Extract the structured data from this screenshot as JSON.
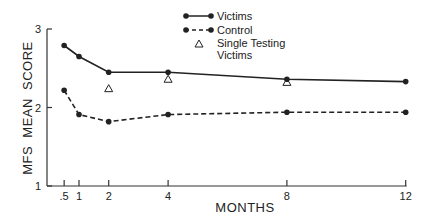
{
  "chart_data": {
    "type": "line",
    "title": "",
    "xlabel": "MONTHS",
    "ylabel": "MFS  MEAN SCORE",
    "x_ticks": [
      ".5",
      "1",
      "2",
      "4",
      "8",
      "12"
    ],
    "y_ticks": [
      "1",
      "2",
      "3"
    ],
    "xlim": [
      0,
      12
    ],
    "ylim": [
      1,
      3
    ],
    "grid": false,
    "legend_position": "top-right",
    "x": [
      0.5,
      1,
      2,
      4,
      8,
      12
    ],
    "series": [
      {
        "name": "Victims",
        "style": "solid-line-circle",
        "x": [
          0.5,
          1,
          2,
          4,
          8,
          12
        ],
        "values": [
          2.79,
          2.65,
          2.45,
          2.45,
          2.36,
          2.33
        ]
      },
      {
        "name": "Control",
        "style": "dashed-line-circle",
        "x": [
          0.5,
          1,
          2,
          4,
          8,
          12
        ],
        "values": [
          2.22,
          1.91,
          1.82,
          1.91,
          1.94,
          1.94
        ]
      },
      {
        "name": "Single Testing Victims",
        "style": "triangle-marker",
        "x": [
          2,
          4,
          8
        ],
        "values": [
          2.24,
          2.36,
          2.32
        ]
      }
    ]
  },
  "legend": {
    "victims": "Victims",
    "control": "Control",
    "single_line1": "Single Testing",
    "single_line2": "Victims"
  },
  "axes": {
    "xlabel": "MONTHS",
    "ylabel": "MFS  MEAN SCORE",
    "x_ticks": [
      ".5",
      "1",
      "2",
      "4",
      "8",
      "12"
    ],
    "y_ticks": [
      "1",
      "2",
      "3"
    ]
  }
}
